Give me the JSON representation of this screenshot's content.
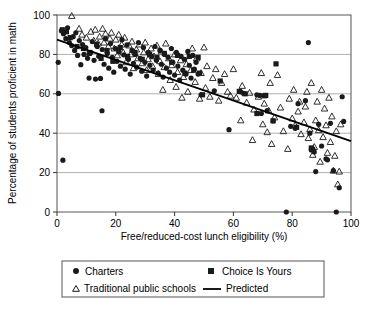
{
  "chart_data": {
    "type": "scatter",
    "title": "",
    "xlabel": "Free/reduced-cost lunch eligibility (%)",
    "ylabel": "Percentage of students proficient in math",
    "xlim": [
      0,
      100
    ],
    "ylim": [
      0,
      100
    ],
    "xticks": [
      0,
      20,
      40,
      60,
      80,
      100
    ],
    "yticks": [
      0,
      20,
      40,
      60,
      80,
      100
    ],
    "grid": "horizontal",
    "legend_position": "below-plot",
    "colors": {
      "marker": "#1a1a1a",
      "line": "#000000",
      "grid": "#b0b0b0",
      "frame": "#555555",
      "background": "#ffffff"
    },
    "series": [
      {
        "name": "Charters",
        "marker": "filled-circle",
        "points": [
          [
            0.4,
            76.0
          ],
          [
            0.5,
            60.2
          ],
          [
            2.0,
            26.3
          ],
          [
            15.3,
            51.4
          ],
          [
            1.5,
            92.0
          ],
          [
            2.2,
            90.5
          ],
          [
            3.0,
            88.0
          ],
          [
            3.6,
            93.5
          ],
          [
            4.2,
            86.0
          ],
          [
            5.0,
            84.5
          ],
          [
            5.5,
            89.0
          ],
          [
            6.0,
            82.0
          ],
          [
            6.4,
            91.0
          ],
          [
            7.0,
            79.5
          ],
          [
            7.6,
            87.0
          ],
          [
            8.1,
            74.8
          ],
          [
            8.7,
            85.0
          ],
          [
            9.2,
            80.0
          ],
          [
            9.8,
            83.5
          ],
          [
            10.4,
            78.0
          ],
          [
            10.9,
            68.0
          ],
          [
            11.5,
            81.0
          ],
          [
            12.0,
            86.5
          ],
          [
            12.6,
            77.0
          ],
          [
            13.1,
            67.5
          ],
          [
            13.7,
            84.0
          ],
          [
            14.2,
            79.0
          ],
          [
            14.8,
            67.8
          ],
          [
            15.4,
            82.5
          ],
          [
            16.0,
            75.0
          ],
          [
            16.5,
            88.0
          ],
          [
            17.1,
            80.5
          ],
          [
            17.6,
            73.0
          ],
          [
            18.2,
            85.5
          ],
          [
            18.8,
            78.5
          ],
          [
            19.3,
            71.0
          ],
          [
            19.9,
            83.0
          ],
          [
            20.4,
            76.5
          ],
          [
            21.0,
            81.5
          ],
          [
            21.6,
            74.0
          ],
          [
            22.1,
            87.5
          ],
          [
            22.7,
            79.8
          ],
          [
            23.2,
            72.5
          ],
          [
            23.8,
            84.8
          ],
          [
            24.3,
            77.5
          ],
          [
            24.9,
            70.0
          ],
          [
            25.5,
            82.0
          ],
          [
            26.0,
            75.5
          ],
          [
            26.6,
            80.0
          ],
          [
            27.1,
            73.5
          ],
          [
            27.7,
            86.0
          ],
          [
            28.3,
            78.0
          ],
          [
            28.8,
            71.5
          ],
          [
            29.4,
            83.5
          ],
          [
            29.9,
            76.0
          ],
          [
            30.5,
            69.0
          ],
          [
            31.0,
            81.0
          ],
          [
            31.6,
            74.5
          ],
          [
            32.2,
            79.0
          ],
          [
            32.7,
            72.0
          ],
          [
            33.3,
            84.0
          ],
          [
            33.8,
            77.0
          ],
          [
            34.4,
            70.5
          ],
          [
            35.0,
            82.0
          ],
          [
            35.5,
            75.0
          ],
          [
            36.1,
            68.5
          ],
          [
            36.6,
            80.0
          ],
          [
            37.2,
            73.0
          ],
          [
            37.8,
            78.5
          ],
          [
            38.3,
            71.0
          ],
          [
            38.9,
            83.0
          ],
          [
            39.4,
            76.0
          ],
          [
            40.0,
            69.5
          ],
          [
            40.6,
            81.0
          ],
          [
            41.1,
            74.0
          ],
          [
            41.7,
            67.0
          ],
          [
            42.2,
            79.0
          ],
          [
            42.8,
            72.0
          ],
          [
            43.4,
            77.5
          ],
          [
            43.9,
            70.0
          ],
          [
            44.5,
            81.5
          ],
          [
            45.0,
            74.5
          ],
          [
            45.6,
            68.0
          ],
          [
            46.2,
            79.5
          ],
          [
            46.7,
            72.5
          ],
          [
            47.3,
            76.0
          ],
          [
            48.0,
            70.0
          ],
          [
            49.0,
            59.5
          ],
          [
            53.5,
            61.5
          ],
          [
            58.5,
            41.8
          ],
          [
            62.5,
            61.0
          ],
          [
            63.5,
            60.2
          ],
          [
            68.0,
            59.5
          ],
          [
            69.0,
            59.2
          ],
          [
            69.5,
            50.0
          ],
          [
            71.5,
            51.5
          ],
          [
            73.5,
            46.2
          ],
          [
            78.0,
            0.0
          ],
          [
            79.5,
            43.5
          ],
          [
            81.0,
            42.5
          ],
          [
            82.0,
            55.0
          ],
          [
            84.5,
            56.5
          ],
          [
            85.5,
            86.0
          ],
          [
            86.0,
            40.0
          ],
          [
            86.5,
            31.5
          ],
          [
            87.0,
            32.0
          ],
          [
            87.5,
            30.5
          ],
          [
            88.0,
            20.5
          ],
          [
            89.0,
            44.5
          ],
          [
            90.0,
            33.5
          ],
          [
            91.5,
            27.0
          ],
          [
            92.0,
            26.5
          ],
          [
            93.0,
            45.0
          ],
          [
            94.0,
            21.0
          ],
          [
            95.0,
            0.0
          ],
          [
            96.0,
            12.3
          ],
          [
            97.0,
            58.5
          ],
          [
            97.5,
            46.0
          ]
        ]
      },
      {
        "name": "Choice Is Yours",
        "marker": "filled-square",
        "points": [
          [
            1.8,
            92.5
          ],
          [
            3.2,
            91.5
          ],
          [
            4.5,
            88.5
          ],
          [
            6.8,
            84.0
          ],
          [
            9.0,
            83.0
          ],
          [
            11.0,
            80.5
          ],
          [
            13.5,
            85.0
          ],
          [
            15.0,
            78.0
          ],
          [
            17.0,
            82.0
          ],
          [
            19.0,
            76.5
          ],
          [
            21.5,
            83.5
          ],
          [
            24.0,
            79.0
          ],
          [
            26.5,
            81.0
          ],
          [
            29.0,
            77.5
          ],
          [
            31.5,
            80.0
          ],
          [
            34.0,
            78.5
          ],
          [
            36.5,
            80.5
          ],
          [
            39.0,
            76.0
          ],
          [
            41.0,
            79.5
          ],
          [
            43.5,
            70.5
          ],
          [
            45.0,
            79.0
          ],
          [
            46.5,
            72.0
          ],
          [
            48.0,
            78.5
          ],
          [
            48.5,
            70.5
          ],
          [
            49.5,
            59.5
          ],
          [
            55.5,
            66.5
          ],
          [
            62.0,
            61.2
          ],
          [
            64.0,
            60.0
          ],
          [
            68.0,
            50.0
          ],
          [
            70.5,
            59.0
          ],
          [
            71.0,
            59.2
          ],
          [
            73.5,
            46.3
          ],
          [
            74.5,
            75.2
          ],
          [
            81.5,
            43.0
          ],
          [
            86.5,
            32.5
          ]
        ]
      },
      {
        "name": "Traditional public schools",
        "marker": "open-triangle",
        "points": [
          [
            5.0,
            99.5
          ],
          [
            7.5,
            93.0
          ],
          [
            8.5,
            90.0
          ],
          [
            10.0,
            88.5
          ],
          [
            11.5,
            91.5
          ],
          [
            12.5,
            87.0
          ],
          [
            13.0,
            92.5
          ],
          [
            14.0,
            85.5
          ],
          [
            14.5,
            89.0
          ],
          [
            15.5,
            93.0
          ],
          [
            16.0,
            86.0
          ],
          [
            16.5,
            90.5
          ],
          [
            17.5,
            84.0
          ],
          [
            18.0,
            88.0
          ],
          [
            18.5,
            91.0
          ],
          [
            19.5,
            83.0
          ],
          [
            20.0,
            87.5
          ],
          [
            20.5,
            79.5
          ],
          [
            21.0,
            90.0
          ],
          [
            22.0,
            85.0
          ],
          [
            22.5,
            81.0
          ],
          [
            23.0,
            88.5
          ],
          [
            23.5,
            76.0
          ],
          [
            24.5,
            84.5
          ],
          [
            25.0,
            80.0
          ],
          [
            25.5,
            86.5
          ],
          [
            26.0,
            73.0
          ],
          [
            27.0,
            82.5
          ],
          [
            27.5,
            78.0
          ],
          [
            28.0,
            85.0
          ],
          [
            29.0,
            75.5
          ],
          [
            29.5,
            81.0
          ],
          [
            30.0,
            86.0
          ],
          [
            30.5,
            72.0
          ],
          [
            31.0,
            77.5
          ],
          [
            32.0,
            83.0
          ],
          [
            32.5,
            74.0
          ],
          [
            33.0,
            79.0
          ],
          [
            34.0,
            84.5
          ],
          [
            34.5,
            70.0
          ],
          [
            35.0,
            76.5
          ],
          [
            35.5,
            81.5
          ],
          [
            36.0,
            62.0
          ],
          [
            36.5,
            73.5
          ],
          [
            37.0,
            85.5
          ],
          [
            38.0,
            78.0
          ],
          [
            38.5,
            67.0
          ],
          [
            39.0,
            74.5
          ],
          [
            40.0,
            80.0
          ],
          [
            40.5,
            63.5
          ],
          [
            41.0,
            71.0
          ],
          [
            42.0,
            77.0
          ],
          [
            42.5,
            58.0
          ],
          [
            43.0,
            68.5
          ],
          [
            44.0,
            75.0
          ],
          [
            44.5,
            61.0
          ],
          [
            45.5,
            72.0
          ],
          [
            46.0,
            83.0
          ],
          [
            47.0,
            66.0
          ],
          [
            47.5,
            78.0
          ],
          [
            48.5,
            57.5
          ],
          [
            49.0,
            70.5
          ],
          [
            50.0,
            83.5
          ],
          [
            50.5,
            63.0
          ],
          [
            51.0,
            74.0
          ],
          [
            52.0,
            58.5
          ],
          [
            53.0,
            68.0
          ],
          [
            54.0,
            72.5
          ],
          [
            55.0,
            56.5
          ],
          [
            56.0,
            65.5
          ],
          [
            57.0,
            70.0
          ],
          [
            58.0,
            61.0
          ],
          [
            59.0,
            59.0
          ],
          [
            60.0,
            72.5
          ],
          [
            61.0,
            58.0
          ],
          [
            62.5,
            46.5
          ],
          [
            63.0,
            64.0
          ],
          [
            64.5,
            55.5
          ],
          [
            65.5,
            60.5
          ],
          [
            66.5,
            36.5
          ],
          [
            67.0,
            52.0
          ],
          [
            68.5,
            58.5
          ],
          [
            69.5,
            70.5
          ],
          [
            70.0,
            44.5
          ],
          [
            70.5,
            55.0
          ],
          [
            71.5,
            40.5
          ],
          [
            72.0,
            51.5
          ],
          [
            72.5,
            65.5
          ],
          [
            73.0,
            34.5
          ],
          [
            74.0,
            48.0
          ],
          [
            75.0,
            69.5
          ],
          [
            76.0,
            53.0
          ],
          [
            77.0,
            41.0
          ],
          [
            78.5,
            32.0
          ],
          [
            79.0,
            57.5
          ],
          [
            80.0,
            47.5
          ],
          [
            80.5,
            62.0
          ],
          [
            81.0,
            44.0
          ],
          [
            82.0,
            51.0
          ],
          [
            82.5,
            56.0
          ],
          [
            83.0,
            39.5
          ],
          [
            84.0,
            45.5
          ],
          [
            84.5,
            53.5
          ],
          [
            85.0,
            61.0
          ],
          [
            85.5,
            37.5
          ],
          [
            86.0,
            42.0
          ],
          [
            86.5,
            65.5
          ],
          [
            87.0,
            29.0
          ],
          [
            87.5,
            33.0
          ],
          [
            88.0,
            46.5
          ],
          [
            88.5,
            56.0
          ],
          [
            89.0,
            41.5
          ],
          [
            89.5,
            25.5
          ],
          [
            90.0,
            62.0
          ],
          [
            90.5,
            38.0
          ],
          [
            91.0,
            52.5
          ],
          [
            91.5,
            44.0
          ],
          [
            92.0,
            30.0
          ],
          [
            92.5,
            58.0
          ],
          [
            93.0,
            35.5
          ],
          [
            93.5,
            48.5
          ],
          [
            94.0,
            21.0
          ],
          [
            94.5,
            28.5
          ],
          [
            95.0,
            41.0
          ],
          [
            95.5,
            14.0
          ],
          [
            96.0,
            20.5
          ],
          [
            96.5,
            44.5
          ]
        ]
      }
    ],
    "predicted_line": {
      "name": "Predicted",
      "points": [
        [
          0,
          87.5
        ],
        [
          100,
          36.0
        ]
      ]
    }
  },
  "legend": {
    "items": [
      {
        "label": "Charters",
        "marker": "filled-circle"
      },
      {
        "label": "Choice Is Yours",
        "marker": "filled-square"
      },
      {
        "label": "Traditional public schools",
        "marker": "open-triangle"
      },
      {
        "label": "Predicted",
        "marker": "line"
      }
    ]
  },
  "axes": {
    "x_title": "Free/reduced-cost lunch eligibility (%)",
    "y_title": "Percentage of students proficient in math",
    "x_tick_labels": [
      "0",
      "20",
      "40",
      "60",
      "80",
      "100"
    ],
    "y_tick_labels": [
      "0",
      "20",
      "40",
      "60",
      "80",
      "100"
    ]
  }
}
